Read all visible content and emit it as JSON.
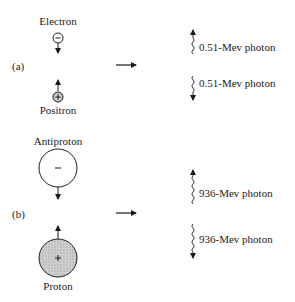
{
  "panels": [
    {
      "tag": "(a)",
      "top_particle": {
        "name": "Electron",
        "sign": "−",
        "charge": "negative",
        "size": "small"
      },
      "bottom_particle": {
        "name": "Positron",
        "sign": "+",
        "charge": "positive",
        "size": "small"
      },
      "photons": [
        {
          "label": "0.51-Mev photon",
          "direction": "up"
        },
        {
          "label": "0.51-Mev photon",
          "direction": "down"
        }
      ]
    },
    {
      "tag": "(b)",
      "top_particle": {
        "name": "Antiproton",
        "sign": "−",
        "charge": "negative",
        "size": "large"
      },
      "bottom_particle": {
        "name": "Proton",
        "sign": "+",
        "charge": "positive",
        "size": "large"
      },
      "photons": [
        {
          "label": "936-Mev photon",
          "direction": "up"
        },
        {
          "label": "936-Mev photon",
          "direction": "down"
        }
      ]
    }
  ],
  "colors": {
    "ink": "#1a1a1a",
    "positive_fill": "#c8c8c8",
    "negative_fill": "#ffffff"
  }
}
